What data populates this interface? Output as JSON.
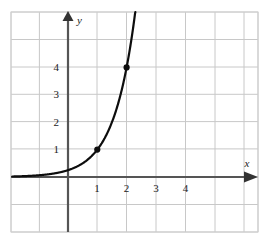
{
  "chart_data": {
    "type": "line",
    "title": "",
    "subtitle": "",
    "xlabel": "x",
    "ylabel": "y",
    "function_description": "exponential curve through (1, 1) and (2, 4)",
    "expression": "y = 4^(x-1)",
    "x": [
      -0.45,
      -0.3,
      -0.15,
      0,
      0.15,
      0.3,
      0.45,
      0.6,
      0.75,
      0.9,
      1,
      1.1,
      1.25,
      1.4,
      1.55,
      1.7,
      1.85,
      2,
      2.15,
      2.3,
      2.45,
      2.55
    ],
    "y": [
      0.1088,
      0.1487,
      0.2031,
      0.25,
      0.3789,
      0.4353,
      0.5946,
      0.8123,
      1.0,
      1.3161,
      1.0,
      1.6245,
      2.2974,
      3.0314,
      4.1401,
      5.6569,
      7.7285,
      4.0,
      14.429,
      19.713,
      26.93,
      32.0
    ],
    "series": [
      {
        "name": "y = 4^(x-1)",
        "color": "#0d0d0d",
        "line_width": 2.2
      }
    ],
    "points": [
      {
        "label": "(1, 1)",
        "x": 1,
        "y": 1
      },
      {
        "label": "(2, 4)",
        "x": 2,
        "y": 4
      }
    ],
    "point_color": "#0d0d0d",
    "xlim": [
      -2,
      6.6
    ],
    "ylim": [
      -2,
      5.9
    ],
    "xticks": [
      1,
      2,
      3,
      4
    ],
    "yticks": [
      1,
      2,
      3,
      4
    ],
    "xtick_labels": [
      "1",
      "2",
      "3",
      "4"
    ],
    "ytick_labels": [
      "1",
      "2",
      "3",
      "4"
    ],
    "grid": true,
    "grid_color": "#c8c8c8",
    "grid_spacing_units": 1,
    "axis_color": "#555555",
    "axis_arrows": true,
    "border": true,
    "border_color": "#cfcfcf",
    "legend": null,
    "legend_position": "none",
    "annotations": []
  },
  "axes": {
    "x_axis_label": "x",
    "y_axis_label": "y"
  }
}
